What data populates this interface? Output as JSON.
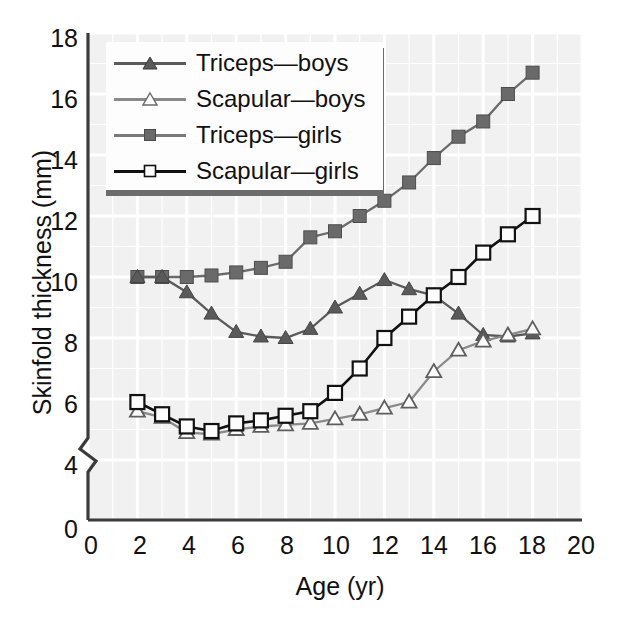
{
  "chart_data": {
    "type": "line",
    "title": "",
    "xlabel": "Age (yr)",
    "ylabel": "Skinfold thickness (mm)",
    "xlim": [
      0,
      20
    ],
    "ylim": [
      0,
      18
    ],
    "y_axis_break": "between 0 and 4",
    "yticks": [
      0,
      4,
      6,
      8,
      10,
      12,
      14,
      16,
      18
    ],
    "xticks": [
      0,
      2,
      4,
      6,
      8,
      10,
      12,
      14,
      16,
      18,
      20
    ],
    "grid": true,
    "legend_position": "upper left inside plot",
    "x": [
      2,
      3,
      4,
      5,
      6,
      7,
      8,
      9,
      10,
      11,
      12,
      13,
      14,
      15,
      16,
      17,
      18
    ],
    "series": [
      {
        "name": "Triceps—boys",
        "marker": "filled-triangle",
        "color": "#5a5a5a",
        "values": [
          10.0,
          10.0,
          9.5,
          8.8,
          8.2,
          8.05,
          8.0,
          8.3,
          9.0,
          9.45,
          9.9,
          9.6,
          9.4,
          8.8,
          8.1,
          8.05,
          8.15
        ]
      },
      {
        "name": "Scapular—boys",
        "marker": "open-triangle",
        "color": "#8a8a8a",
        "values": [
          5.6,
          5.4,
          4.9,
          4.85,
          5.0,
          5.1,
          5.15,
          5.2,
          5.35,
          5.5,
          5.7,
          5.9,
          6.9,
          7.6,
          7.9,
          8.1,
          8.3
        ]
      },
      {
        "name": "Triceps—girls",
        "marker": "filled-square",
        "color": "#6a6a6a",
        "values": [
          10.0,
          10.0,
          10.0,
          10.05,
          10.15,
          10.3,
          10.5,
          11.3,
          11.5,
          12.0,
          12.5,
          13.1,
          13.9,
          14.6,
          15.1,
          16.0,
          16.7
        ]
      },
      {
        "name": "Scapular—girls",
        "marker": "open-square",
        "color": "#111111",
        "values": [
          5.9,
          5.5,
          5.1,
          4.95,
          5.2,
          5.3,
          5.45,
          5.6,
          6.2,
          7.0,
          8.0,
          8.7,
          9.4,
          10.0,
          10.8,
          11.4,
          12.0
        ]
      }
    ]
  },
  "axes": {
    "ylabel": "Skinfold thickness (mm)",
    "xlabel": "Age (yr)",
    "yticks": [
      "18",
      "16",
      "14",
      "12",
      "10",
      "8",
      "6",
      "4",
      "0"
    ],
    "xticks": [
      "0",
      "2",
      "4",
      "6",
      "8",
      "10",
      "12",
      "14",
      "16",
      "18",
      "20"
    ],
    "origin_label": "0"
  },
  "legend": {
    "items": [
      {
        "label": "Triceps—boys",
        "marker": "filled-triangle",
        "color": "#5a5a5a"
      },
      {
        "label": "Scapular—boys",
        "marker": "open-triangle",
        "color": "#8a8a8a"
      },
      {
        "label": "Triceps—girls",
        "marker": "filled-square",
        "color": "#6a6a6a"
      },
      {
        "label": "Scapular—girls",
        "marker": "open-square",
        "color": "#111111"
      }
    ]
  },
  "style": {
    "plot_bg": "#f2f2f2",
    "grid_color": "#ffffff",
    "axis_color": "#3b3b3b",
    "page_bg": "#ffffff"
  }
}
